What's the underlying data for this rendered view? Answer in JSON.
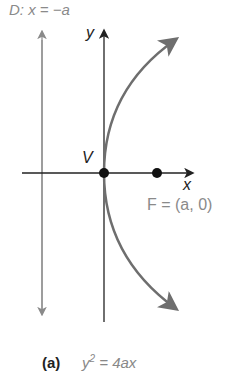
{
  "diagram": {
    "directrix_label": "D: x = −a",
    "y_axis_label": "y",
    "x_axis_label": "x",
    "vertex_label": "V",
    "focus_label": "F = (a, 0)",
    "caption": {
      "part": "(a)",
      "equation_base": "y",
      "equation_exp": "2",
      "equation_rest": " = 4ax"
    },
    "colors": {
      "curve": "#6e6e6e",
      "axes": "#222222",
      "directrix": "#8a8a8a",
      "points": "#111111"
    }
  }
}
